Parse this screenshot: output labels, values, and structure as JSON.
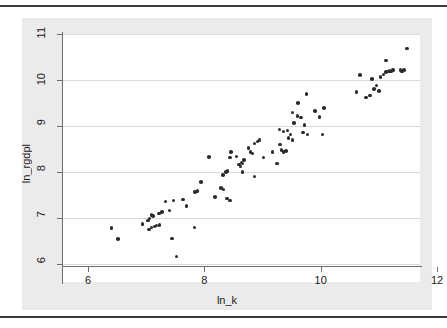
{
  "figure": {
    "background_color": "#ebebeb",
    "plot_background_color": "#ffffff",
    "marker_color": "#2b2b2b",
    "gridline_color": "#d9d9d9",
    "axis_color": "#6e6e6e"
  },
  "axes": {
    "x_title": "ln_k",
    "y_title": "ln_rgdpl",
    "x_ticks": [
      "6",
      "8",
      "10",
      "12"
    ],
    "y_ticks": [
      "6",
      "7",
      "8",
      "9",
      "10",
      "11"
    ]
  },
  "chart_data": {
    "type": "scatter",
    "title": "",
    "xlabel": "ln_k",
    "ylabel": "ln_rgdpl",
    "xlim": [
      6,
      12
    ],
    "ylim": [
      6,
      11
    ],
    "x_ticks": [
      6,
      8,
      10,
      12
    ],
    "y_ticks": [
      6,
      7,
      8,
      9,
      10,
      11
    ],
    "grid": "horizontal",
    "legend": null,
    "marker": "filled-circle",
    "series": [
      {
        "name": "countries",
        "points": [
          [
            6.4,
            6.78
          ],
          [
            6.52,
            6.54
          ],
          [
            6.94,
            6.87
          ],
          [
            7.03,
            6.95
          ],
          [
            7.06,
            6.99
          ],
          [
            7.05,
            6.75
          ],
          [
            7.09,
            6.79
          ],
          [
            7.14,
            6.82
          ],
          [
            7.18,
            6.84
          ],
          [
            7.23,
            6.85
          ],
          [
            7.09,
            7.07
          ],
          [
            7.12,
            7.04
          ],
          [
            7.22,
            7.1
          ],
          [
            7.27,
            7.13
          ],
          [
            7.33,
            7.36
          ],
          [
            7.4,
            7.16
          ],
          [
            7.47,
            7.38
          ],
          [
            7.44,
            6.55
          ],
          [
            7.52,
            6.16
          ],
          [
            7.63,
            7.4
          ],
          [
            7.69,
            7.26
          ],
          [
            7.84,
            7.57
          ],
          [
            7.88,
            7.59
          ],
          [
            7.83,
            6.79
          ],
          [
            7.94,
            7.78
          ],
          [
            8.08,
            8.33
          ],
          [
            8.18,
            7.46
          ],
          [
            8.29,
            7.65
          ],
          [
            8.33,
            7.62
          ],
          [
            8.32,
            7.94
          ],
          [
            8.37,
            8.0
          ],
          [
            8.4,
            8.02
          ],
          [
            8.44,
            8.31
          ],
          [
            8.46,
            8.43
          ],
          [
            8.39,
            7.42
          ],
          [
            8.44,
            7.38
          ],
          [
            8.55,
            8.34
          ],
          [
            8.6,
            8.16
          ],
          [
            8.62,
            8.12
          ],
          [
            8.64,
            8.21
          ],
          [
            8.66,
            8.19
          ],
          [
            8.68,
            8.26
          ],
          [
            8.66,
            8.0
          ],
          [
            8.76,
            8.52
          ],
          [
            8.79,
            8.44
          ],
          [
            8.83,
            8.4
          ],
          [
            8.86,
            8.62
          ],
          [
            8.91,
            8.66
          ],
          [
            8.95,
            8.7
          ],
          [
            8.86,
            7.9
          ],
          [
            9.02,
            8.31
          ],
          [
            9.17,
            8.43
          ],
          [
            9.25,
            8.18
          ],
          [
            9.3,
            8.6
          ],
          [
            9.33,
            8.48
          ],
          [
            9.36,
            8.44
          ],
          [
            9.4,
            8.46
          ],
          [
            9.29,
            8.92
          ],
          [
            9.36,
            8.88
          ],
          [
            9.43,
            8.9
          ],
          [
            9.45,
            8.74
          ],
          [
            9.48,
            8.82
          ],
          [
            9.52,
            8.7
          ],
          [
            9.54,
            9.07
          ],
          [
            9.52,
            9.29
          ],
          [
            9.61,
            9.5
          ],
          [
            9.6,
            9.22
          ],
          [
            9.66,
            9.18
          ],
          [
            9.72,
            9.02
          ],
          [
            9.7,
            8.86
          ],
          [
            9.77,
            8.82
          ],
          [
            9.76,
            9.7
          ],
          [
            9.9,
            9.33
          ],
          [
            9.98,
            9.2
          ],
          [
            10.03,
            8.82
          ],
          [
            10.06,
            9.39
          ],
          [
            10.62,
            9.74
          ],
          [
            10.68,
            10.11
          ],
          [
            10.78,
            9.62
          ],
          [
            10.85,
            9.66
          ],
          [
            10.88,
            10.02
          ],
          [
            10.92,
            9.8
          ],
          [
            10.96,
            9.88
          ],
          [
            11.0,
            9.76
          ],
          [
            11.03,
            10.06
          ],
          [
            11.08,
            10.12
          ],
          [
            11.12,
            10.17
          ],
          [
            11.15,
            10.18
          ],
          [
            11.18,
            10.2
          ],
          [
            11.21,
            10.19
          ],
          [
            11.24,
            10.22
          ],
          [
            11.12,
            10.42
          ],
          [
            11.37,
            10.22
          ],
          [
            11.4,
            10.18
          ],
          [
            11.43,
            10.22
          ],
          [
            11.48,
            10.68
          ]
        ]
      }
    ]
  }
}
